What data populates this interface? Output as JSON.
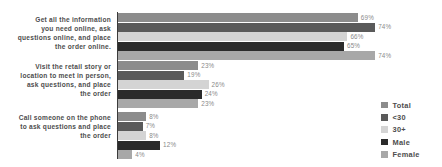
{
  "chart_data": {
    "type": "bar",
    "orientation": "horizontal",
    "title": "",
    "subtitle": "",
    "xlabel": "",
    "ylabel": "",
    "xlim": [
      0,
      80
    ],
    "grid": false,
    "legend_position": "right",
    "value_suffix": "%",
    "categories": [
      "Get all the information you need online, ask questions online, and place the order online.",
      "Visit the retail story or location to meet in person, ask questions, and place the order",
      "Call someone on the phone to ask questions and place the order"
    ],
    "category_lines": [
      [
        "Get all the information",
        "you need online, ask",
        "questions online, and place",
        "the order online."
      ],
      [
        "Visit the retail story or",
        "location to meet in person,",
        "ask questions, and place",
        "the order"
      ],
      [
        "Call someone on the phone",
        "to ask questions and place",
        "the order"
      ]
    ],
    "series": [
      {
        "name": "Total",
        "color": "#8c8c8c",
        "values": [
          69,
          23,
          8
        ]
      },
      {
        "name": "<30",
        "color": "#5a5a5a",
        "values": [
          74,
          19,
          7
        ]
      },
      {
        "name": "30+",
        "color": "#d4d4d4",
        "values": [
          66,
          26,
          8
        ]
      },
      {
        "name": "Male",
        "color": "#2b2b2b",
        "values": [
          65,
          24,
          12
        ]
      },
      {
        "name": "Female",
        "color": "#a8a8a8",
        "values": [
          74,
          23,
          4
        ]
      }
    ],
    "labels": [
      [
        "69%",
        "74%",
        "66%",
        "65%",
        "74%"
      ],
      [
        "23%",
        "19%",
        "26%",
        "24%",
        "23%"
      ],
      [
        "8%",
        "7%",
        "8%",
        "12%",
        "4%"
      ]
    ]
  },
  "legend": {
    "items": [
      {
        "label": "Total"
      },
      {
        "label": "<30"
      },
      {
        "label": "30+"
      },
      {
        "label": "Male"
      },
      {
        "label": "Female"
      }
    ]
  },
  "colors": {
    "background": "#ffffff",
    "axis": "#3b3b3b",
    "category_text": "#4d4d4d",
    "value_text": "#8a8a8a"
  }
}
